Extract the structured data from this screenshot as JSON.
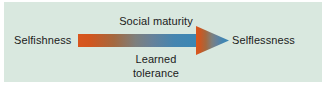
{
  "figure": {
    "panel_background": "#d9e8df",
    "page_background": "#ffffff",
    "text_color": "#1b1b1b"
  },
  "arrow": {
    "name": "gradient-arrow-right",
    "direction": "left-to-right",
    "gradient_start_color": "#d9561e",
    "gradient_mid_color": "#7d7f7d",
    "gradient_end_color": "#3a87b5"
  },
  "labels": {
    "left": "Selfishness",
    "right": "Selflessness",
    "above_arrow": "Social maturity",
    "below_arrow_line1": "Learned",
    "below_arrow_line2": "tolerance"
  }
}
